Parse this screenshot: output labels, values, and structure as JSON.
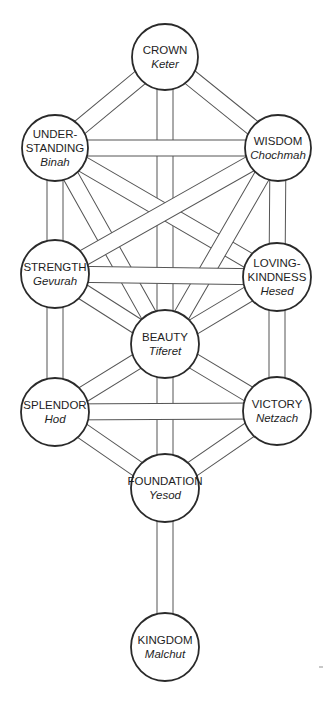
{
  "diagram": {
    "title": "",
    "band_width": 16,
    "colors": {
      "line": "#555555",
      "circle_stroke": "#2a2a2a",
      "text": "#1e1e1e",
      "background": "#ffffff"
    },
    "sefirot": [
      {
        "id": "crown",
        "line1": "CROWN",
        "line2": "",
        "sub": "Keter",
        "cx": 165,
        "cy": 57,
        "r": 33
      },
      {
        "id": "understanding",
        "line1": "UNDER-",
        "line2": "STANDING",
        "sub": "Binah",
        "cx": 55,
        "cy": 148,
        "r": 33
      },
      {
        "id": "wisdom",
        "line1": "WISDOM",
        "line2": "",
        "sub": "Chochmah",
        "cx": 278,
        "cy": 148,
        "r": 33
      },
      {
        "id": "strength",
        "line1": "STRENGTH",
        "line2": "",
        "sub": "Gevurah",
        "cx": 55,
        "cy": 274,
        "r": 34
      },
      {
        "id": "loving-kindness",
        "line1": "LOVING-",
        "line2": "KINDNESS",
        "sub": "Hesed",
        "cx": 277,
        "cy": 277,
        "r": 34
      },
      {
        "id": "beauty",
        "line1": "BEAUTY",
        "line2": "",
        "sub": "Tiferet",
        "cx": 165,
        "cy": 344,
        "r": 34
      },
      {
        "id": "splendor",
        "line1": "SPLENDOR",
        "line2": "",
        "sub": "Hod",
        "cx": 55,
        "cy": 412,
        "r": 34
      },
      {
        "id": "victory",
        "line1": "VICTORY",
        "line2": "",
        "sub": "Netzach",
        "cx": 277,
        "cy": 411,
        "r": 34
      },
      {
        "id": "foundation",
        "line1": "FOUNDATION",
        "line2": "",
        "sub": "Yesod",
        "cx": 165,
        "cy": 488,
        "r": 34
      },
      {
        "id": "kingdom",
        "line1": "KINGDOM",
        "line2": "",
        "sub": "Malchut",
        "cx": 165,
        "cy": 647,
        "r": 34
      }
    ],
    "paths": [
      [
        "crown",
        "understanding"
      ],
      [
        "crown",
        "wisdom"
      ],
      [
        "crown",
        "beauty"
      ],
      [
        "understanding",
        "wisdom"
      ],
      [
        "understanding",
        "strength"
      ],
      [
        "understanding",
        "beauty"
      ],
      [
        "understanding",
        "loving-kindness"
      ],
      [
        "wisdom",
        "loving-kindness"
      ],
      [
        "wisdom",
        "beauty"
      ],
      [
        "wisdom",
        "strength"
      ],
      [
        "strength",
        "loving-kindness"
      ],
      [
        "strength",
        "beauty"
      ],
      [
        "strength",
        "splendor"
      ],
      [
        "loving-kindness",
        "beauty"
      ],
      [
        "loving-kindness",
        "victory"
      ],
      [
        "beauty",
        "splendor"
      ],
      [
        "beauty",
        "victory"
      ],
      [
        "beauty",
        "foundation"
      ],
      [
        "splendor",
        "victory"
      ],
      [
        "splendor",
        "foundation"
      ],
      [
        "victory",
        "foundation"
      ],
      [
        "foundation",
        "kingdom"
      ]
    ]
  }
}
